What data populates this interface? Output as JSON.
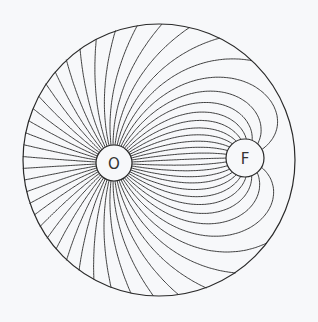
{
  "diagram": {
    "type": "flow-field-lines",
    "background": "#f7f8fa",
    "stroke_color": "#2a2a2a",
    "boundary": {
      "cx": 159,
      "cy": 160,
      "r": 136
    },
    "source": {
      "label": "O",
      "cx": 114,
      "cy": 163,
      "r": 18
    },
    "sink": {
      "label": "F",
      "cx": 245,
      "cy": 158,
      "r": 19
    },
    "line_count": 56,
    "sink_strength": 0.42
  }
}
